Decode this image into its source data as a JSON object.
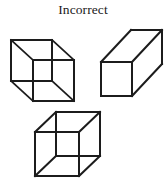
{
  "page": {
    "title": "Incorrect",
    "background_color": "#ffffff",
    "width": 166,
    "height": 182
  },
  "caption": {
    "text": "Incorrect",
    "color": "#1a1a1a",
    "align": "center"
  },
  "style": {
    "stroke_color": "#1c1c1c",
    "fill_color": "#ffffff",
    "stroke_width": 2
  },
  "figures": [
    {
      "name": "cube-diagonal",
      "label": "Cube with crossed diagonal edges",
      "type": "wireframe-cube",
      "position": {
        "x": 8,
        "y": 35,
        "width": 72,
        "height": 68
      },
      "front_face": {
        "x": 2,
        "y": 4,
        "width": 42,
        "height": 42
      },
      "back_face": {
        "x": 26,
        "y": 28,
        "width": 42,
        "height": 42
      },
      "hidden_lines_shown": true
    },
    {
      "name": "cuboid-prism",
      "label": "Rectangular prism in oblique view",
      "type": "solid-cuboid",
      "position": {
        "x": 96,
        "y": 18,
        "width": 70,
        "height": 82
      },
      "front_face": {
        "x": 4,
        "y": 42,
        "width": 34,
        "height": 34
      },
      "depth_offset": {
        "dx": 30,
        "dy": -30
      },
      "hidden_lines_shown": false
    },
    {
      "name": "necker-cube",
      "label": "Necker cube wireframe",
      "type": "wireframe-cube",
      "position": {
        "x": 30,
        "y": 106,
        "width": 78,
        "height": 76
      },
      "front_face": {
        "x": 4,
        "y": 26,
        "width": 44,
        "height": 44
      },
      "back_face": {
        "x": 26,
        "y": 4,
        "width": 44,
        "height": 44
      },
      "hidden_lines_shown": true
    }
  ]
}
